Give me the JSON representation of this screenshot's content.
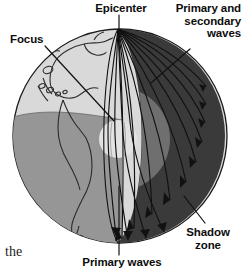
{
  "figure": {
    "kind": "earth-seismic-wave-cross-section",
    "background": "#ffffff"
  },
  "labels": {
    "epicenter": "Epicenter",
    "focus": "Focus",
    "primary_and_secondary_waves": "Primary and\nsecondary\nwaves",
    "shadow_zone": "Shadow\nzone",
    "primary_waves": "Primary waves"
  },
  "body_text": {
    "fragment": "the"
  },
  "colors": {
    "page_background": "#ffffff",
    "crust_light": "#d9d9d9",
    "crust_mid": "#969696",
    "mantle_dark": "#3a3a3a",
    "outer_core": "#6f6f6f",
    "inner_core": "#e2e2e2",
    "outline": "#1a1a1a",
    "ray_line": "#111111",
    "text": "#0d0d0d"
  },
  "geometry": {
    "globe_center_x": 120,
    "globe_center_y": 136,
    "globe_radius": 108,
    "epicenter_x": 118,
    "epicenter_y": 28,
    "inner_core_center_x": 118,
    "inner_core_center_y": 139,
    "inner_core_radius": 19,
    "outer_core_radius": 52
  },
  "leader_lines": {
    "epicenter": {
      "from": [
        119,
        16
      ],
      "to": [
        119,
        30
      ]
    },
    "focus": {
      "from": [
        45,
        46
      ],
      "to": [
        114,
        120
      ]
    },
    "primary_and_secondary_waves": {
      "from": [
        190,
        48
      ],
      "to": [
        152,
        82
      ]
    },
    "shadow_zone": {
      "from": [
        204,
        222
      ],
      "to": [
        184,
        196
      ]
    },
    "primary_waves": {
      "from": [
        119,
        254
      ],
      "to": [
        119,
        186
      ]
    }
  }
}
